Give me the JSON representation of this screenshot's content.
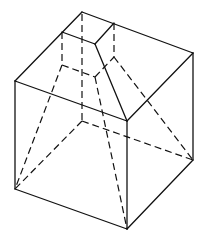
{
  "figure": {
    "colors": {
      "line": "#111111",
      "background": "#ffffff"
    },
    "vertices": {
      "cube_top_back": [
        82,
        12
      ],
      "cube_top_left": [
        15,
        81
      ],
      "cube_top_right": [
        193,
        53
      ],
      "cube_top_front": [
        127,
        121
      ],
      "cube_bottom_left": [
        15,
        189
      ],
      "cube_bottom_right": [
        193,
        160
      ],
      "cube_bottom_front": [
        127,
        229
      ],
      "cube_bottom_back": [
        82,
        121
      ],
      "sq_top_back": [
        82,
        12
      ],
      "sq_top_left": [
        62,
        32
      ],
      "sq_top_front": [
        95,
        44
      ],
      "sq_top_right": [
        114,
        23
      ],
      "sq_mid_left": [
        62,
        65
      ],
      "sq_mid_back": [
        82,
        54
      ],
      "sq_mid_front": [
        95,
        77
      ],
      "sq_mid_right": [
        114,
        57
      ]
    }
  }
}
